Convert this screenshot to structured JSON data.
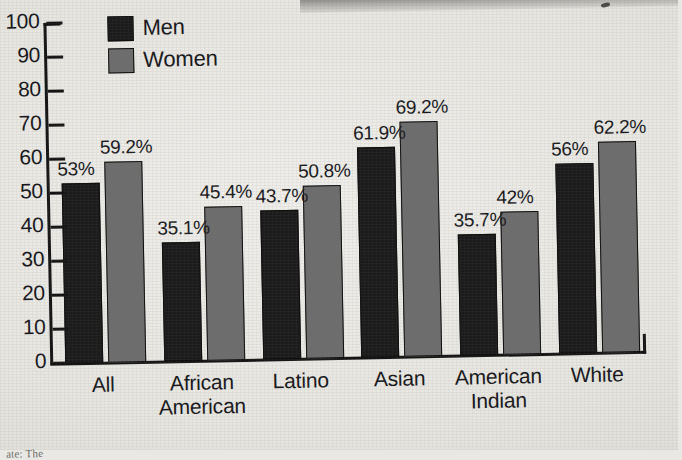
{
  "legend": {
    "items": [
      {
        "label": "Men",
        "color": "#1b1b1b"
      },
      {
        "label": "Women",
        "color": "#6d6d6d"
      }
    ]
  },
  "axis": {
    "y_ticks": [
      "100",
      "90",
      "80",
      "70",
      "60",
      "50",
      "40",
      "30",
      "20",
      "10",
      "0"
    ]
  },
  "footnote": {
    "text": "ate: The"
  },
  "chart_data": {
    "type": "bar",
    "title": "",
    "xlabel": "",
    "ylabel": "",
    "ylim": [
      0,
      100
    ],
    "ytick_interval": 10,
    "grid": false,
    "legend_position": "top-left",
    "categories": [
      "All",
      "African American",
      "Latino",
      "Asian",
      "American Indian",
      "White"
    ],
    "category_lines": [
      [
        "All"
      ],
      [
        "African",
        "American"
      ],
      [
        "Latino"
      ],
      [
        "Asian"
      ],
      [
        "American",
        "Indian"
      ],
      [
        "White"
      ]
    ],
    "series": [
      {
        "name": "Men",
        "color": "#1b1b1b",
        "values": [
          53,
          35.1,
          43.7,
          61.9,
          35.7,
          56
        ],
        "labels": [
          "53%",
          "35.1%",
          "43.7%",
          "61.9%",
          "35.7%",
          "56%"
        ]
      },
      {
        "name": "Women",
        "color": "#6d6d6d",
        "values": [
          59.2,
          45.4,
          50.8,
          69.2,
          42,
          62.2
        ],
        "labels": [
          "59.2%",
          "45.4%",
          "50.8%",
          "69.2%",
          "42%",
          "62.2%"
        ]
      }
    ]
  }
}
